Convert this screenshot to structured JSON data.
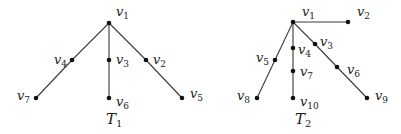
{
  "trees": [
    {
      "name": "T",
      "sub": "1",
      "label_pos": [
        106,
        124
      ],
      "nodes": [
        {
          "id": "v1",
          "base": "v",
          "sub": "1",
          "x": 109,
          "y": 23,
          "lx": 116,
          "ly": 16
        },
        {
          "id": "v2",
          "base": "v",
          "sub": "2",
          "x": 146,
          "y": 60,
          "lx": 153,
          "ly": 64
        },
        {
          "id": "v3",
          "base": "v",
          "sub": "3",
          "x": 109,
          "y": 60,
          "lx": 116,
          "ly": 64
        },
        {
          "id": "v4",
          "base": "v",
          "sub": "4",
          "x": 72,
          "y": 60,
          "lx": 54,
          "ly": 64
        },
        {
          "id": "v5",
          "base": "v",
          "sub": "5",
          "x": 182,
          "y": 98,
          "lx": 190,
          "ly": 98
        },
        {
          "id": "v6",
          "base": "v",
          "sub": "6",
          "x": 109,
          "y": 98,
          "lx": 116,
          "ly": 106
        },
        {
          "id": "v7",
          "base": "v",
          "sub": "7",
          "x": 36,
          "y": 98,
          "lx": 17,
          "ly": 100
        }
      ],
      "edges": [
        [
          "v1",
          "v4"
        ],
        [
          "v4",
          "v7"
        ],
        [
          "v1",
          "v3"
        ],
        [
          "v3",
          "v6"
        ],
        [
          "v1",
          "v2"
        ],
        [
          "v2",
          "v5"
        ]
      ]
    },
    {
      "name": "T",
      "sub": "2",
      "label_pos": [
        295,
        124
      ],
      "nodes": [
        {
          "id": "v1",
          "base": "v",
          "sub": "1",
          "x": 293,
          "y": 22,
          "lx": 302,
          "ly": 16
        },
        {
          "id": "v2",
          "base": "v",
          "sub": "2",
          "x": 348,
          "y": 22,
          "lx": 357,
          "ly": 16
        },
        {
          "id": "v3",
          "base": "v",
          "sub": "3",
          "x": 315,
          "y": 44,
          "lx": 320,
          "ly": 46
        },
        {
          "id": "v4",
          "base": "v",
          "sub": "4",
          "x": 293,
          "y": 48,
          "lx": 298,
          "ly": 54
        },
        {
          "id": "v5",
          "base": "v",
          "sub": "5",
          "x": 275,
          "y": 60,
          "lx": 256,
          "ly": 62
        },
        {
          "id": "v6",
          "base": "v",
          "sub": "6",
          "x": 337,
          "y": 67,
          "lx": 347,
          "ly": 74
        },
        {
          "id": "v7",
          "base": "v",
          "sub": "7",
          "x": 293,
          "y": 71,
          "lx": 300,
          "ly": 76
        },
        {
          "id": "v8",
          "base": "v",
          "sub": "8",
          "x": 257,
          "y": 98,
          "lx": 237,
          "ly": 100
        },
        {
          "id": "v9",
          "base": "v",
          "sub": "9",
          "x": 367,
          "y": 98,
          "lx": 375,
          "ly": 100
        },
        {
          "id": "v10",
          "base": "v",
          "sub": "10",
          "x": 293,
          "y": 98,
          "lx": 300,
          "ly": 106
        }
      ],
      "edges": [
        [
          "v1",
          "v2"
        ],
        [
          "v1",
          "v5"
        ],
        [
          "v5",
          "v8"
        ],
        [
          "v1",
          "v4"
        ],
        [
          "v4",
          "v7"
        ],
        [
          "v7",
          "v10"
        ],
        [
          "v1",
          "v3"
        ],
        [
          "v3",
          "v6"
        ],
        [
          "v6",
          "v9"
        ]
      ]
    }
  ]
}
